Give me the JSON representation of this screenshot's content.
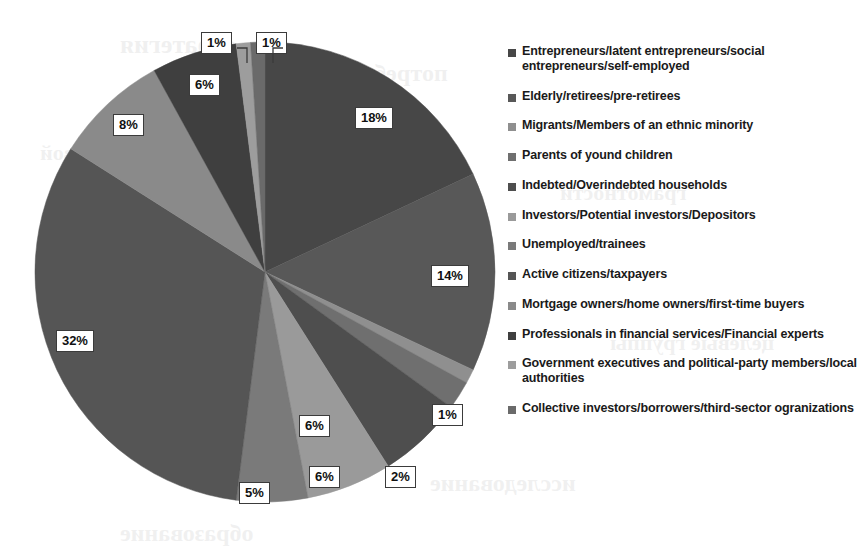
{
  "chart_data": {
    "type": "pie",
    "title": "",
    "subtitle": "",
    "xlabel": "",
    "ylabel": "",
    "legend_position": "right",
    "grid": false,
    "value_unit": "%",
    "start_angle_deg": 0,
    "direction": "clockwise",
    "total": 100,
    "categories": [
      "Entrepreneurs/latent entrepreneurs/social entrepreneurs/self-employed",
      "Elderly/retirees/pre-retirees",
      "Migrants/Members of an ethnic minority",
      "Parents of yound children",
      "Indebted/Overindebted households",
      "Investors/Potential investors/Depositors",
      "Unemployed/trainees",
      "Active citizens/taxpayers",
      "Mortgage owners/home owners/first-time buyers",
      "Professionals in financial services/Financial experts",
      "Government executives and political-party members/local authorities",
      "Collective investors/borrowers/third-sector ogranizations"
    ],
    "values": [
      18,
      14,
      1,
      2,
      6,
      6,
      5,
      32,
      8,
      6,
      1,
      1
    ],
    "labels": [
      "18%",
      "14%",
      "1%",
      "2%",
      "6%",
      "6%",
      "5%",
      "32%",
      "8%",
      "6%",
      "1%",
      "1%"
    ],
    "colors": [
      "#474747",
      "#585858",
      "#8f8f8f",
      "#6f6f6f",
      "#4e4e4e",
      "#9a9a9a",
      "#7a7a7a",
      "#555555",
      "#8a8a8a",
      "#3f3f3f",
      "#9d9d9d",
      "#6a6a6a"
    ]
  },
  "pie": {
    "center_x": 265,
    "center_y": 272,
    "radius": 230,
    "slices": [
      {
        "name": "slice-entrepreneurs",
        "label": "18%",
        "value": 18,
        "color": "#474747"
      },
      {
        "name": "slice-elderly",
        "label": "14%",
        "value": 14,
        "color": "#585858"
      },
      {
        "name": "slice-migrants",
        "label": "1%",
        "value": 1,
        "color": "#8f8f8f"
      },
      {
        "name": "slice-parents",
        "label": "2%",
        "value": 2,
        "color": "#6f6f6f"
      },
      {
        "name": "slice-indebted",
        "label": "6%",
        "value": 6,
        "color": "#4e4e4e"
      },
      {
        "name": "slice-investors",
        "label": "6%",
        "value": 6,
        "color": "#9a9a9a"
      },
      {
        "name": "slice-unemployed",
        "label": "5%",
        "value": 5,
        "color": "#7a7a7a"
      },
      {
        "name": "slice-active-citizens",
        "label": "32%",
        "value": 32,
        "color": "#555555"
      },
      {
        "name": "slice-mortgage",
        "label": "8%",
        "value": 8,
        "color": "#8a8a8a"
      },
      {
        "name": "slice-professionals",
        "label": "6%",
        "value": 6,
        "color": "#3f3f3f"
      },
      {
        "name": "slice-government",
        "label": "1%",
        "value": 1,
        "color": "#9d9d9d"
      },
      {
        "name": "slice-collective",
        "label": "1%",
        "value": 1,
        "color": "#6a6a6a"
      }
    ]
  },
  "data_labels": [
    {
      "name": "data-label-18",
      "text": "18%",
      "x": 355,
      "y": 107,
      "leader": false
    },
    {
      "name": "data-label-14",
      "text": "14%",
      "x": 431,
      "y": 265,
      "leader": false
    },
    {
      "name": "data-label-1-right",
      "text": "1%",
      "x": 432,
      "y": 404,
      "leader": false
    },
    {
      "name": "data-label-2",
      "text": "2%",
      "x": 385,
      "y": 466,
      "leader": false
    },
    {
      "name": "data-label-6-lowerright",
      "text": "6%",
      "x": 299,
      "y": 415,
      "leader": false
    },
    {
      "name": "data-label-6-bottom",
      "text": "6%",
      "x": 309,
      "y": 466,
      "leader": false
    },
    {
      "name": "data-label-5",
      "text": "5%",
      "x": 239,
      "y": 482,
      "leader": false
    },
    {
      "name": "data-label-32",
      "text": "32%",
      "x": 56,
      "y": 330,
      "leader": false
    },
    {
      "name": "data-label-8",
      "text": "8%",
      "x": 113,
      "y": 114,
      "leader": false
    },
    {
      "name": "data-label-6-topleft",
      "text": "6%",
      "x": 189,
      "y": 74,
      "leader": false
    },
    {
      "name": "data-label-1-topleft",
      "text": "1%",
      "x": 201,
      "y": 32,
      "leader": true
    },
    {
      "name": "data-label-1-topright",
      "text": "1%",
      "x": 256,
      "y": 32,
      "leader": true
    }
  ],
  "legend": {
    "items": [
      {
        "label": "Entrepreneurs/latent entrepreneurs/social entrepreneurs/self-employed"
      },
      {
        "label": "Elderly/retirees/pre-retirees"
      },
      {
        "label": "Migrants/Members of an ethnic minority"
      },
      {
        "label": "Parents of yound children"
      },
      {
        "label": "Indebted/Overindebted households"
      },
      {
        "label": "Investors/Potential investors/Depositors"
      },
      {
        "label": "Unemployed/trainees"
      },
      {
        "label": "Active citizens/taxpayers"
      },
      {
        "label": "Mortgage owners/home owners/first-time buyers"
      },
      {
        "label": "Professionals in financial services/Financial experts"
      },
      {
        "label": "Government executives and political-party members/local authorities"
      },
      {
        "label": "Collective investors/borrowers/third-sector ogranizations"
      }
    ]
  },
  "background_bleed": {
    "lines": [
      {
        "text": "стратегия",
        "x": 120,
        "y": 30,
        "size": 26
      },
      {
        "text": "потребителей",
        "x": 300,
        "y": 60,
        "size": 24
      },
      {
        "text": "финансовой",
        "x": 40,
        "y": 140,
        "size": 22
      },
      {
        "text": "грамотности",
        "x": 560,
        "y": 180,
        "size": 22
      },
      {
        "text": "населения",
        "x": 90,
        "y": 250,
        "size": 22
      },
      {
        "text": "целевые группы",
        "x": 610,
        "y": 330,
        "size": 22
      },
      {
        "text": "исследование",
        "x": 430,
        "y": 470,
        "size": 24
      },
      {
        "text": "образование",
        "x": 120,
        "y": 520,
        "size": 24
      }
    ]
  }
}
